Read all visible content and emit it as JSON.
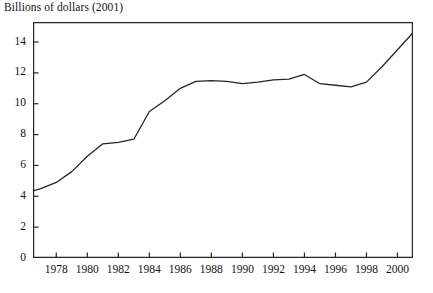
{
  "chart_data": {
    "type": "line",
    "title": "Billions of dollars (2001)",
    "xlabel": "",
    "ylabel": "Billions of dollars (2001)",
    "xlim": [
      1976.5,
      2001.0
    ],
    "ylim": [
      0,
      15.3
    ],
    "grid": false,
    "legend": null,
    "y_ticks": [
      0,
      2,
      4,
      6,
      8,
      10,
      12,
      14
    ],
    "y_tick_labels": [
      "0",
      "2",
      "4",
      "6",
      "8",
      "10",
      "12",
      "14"
    ],
    "x_ticks": [
      1978,
      1980,
      1982,
      1984,
      1986,
      1988,
      1990,
      1992,
      1994,
      1996,
      1998,
      2000
    ],
    "x_tick_labels": [
      "1978",
      "1980",
      "1982",
      "1984",
      "1986",
      "1988",
      "1990",
      "1992",
      "1994",
      "1996",
      "1998",
      "2000"
    ],
    "line_color": "#262626",
    "line_width": 1.3,
    "x": [
      1976.5,
      1977,
      1978,
      1979,
      1980,
      1981,
      1982,
      1983,
      1984,
      1985,
      1986,
      1987,
      1988,
      1989,
      1990,
      1991,
      1992,
      1993,
      1994,
      1995,
      1996,
      1997,
      1998,
      1999,
      2000,
      2001
    ],
    "values": [
      4.35,
      4.5,
      4.9,
      5.6,
      6.6,
      7.4,
      7.5,
      7.7,
      9.5,
      10.2,
      11.0,
      11.45,
      11.5,
      11.45,
      11.3,
      11.4,
      11.55,
      11.6,
      11.9,
      11.3,
      11.2,
      11.1,
      11.4,
      12.4,
      13.5,
      14.6
    ],
    "series": [
      {
        "name": "Billions of dollars (2001)",
        "values": [
          4.35,
          4.5,
          4.9,
          5.6,
          6.6,
          7.4,
          7.5,
          7.7,
          9.5,
          10.2,
          11.0,
          11.45,
          11.5,
          11.45,
          11.3,
          11.4,
          11.55,
          11.6,
          11.9,
          11.3,
          11.2,
          11.1,
          11.4,
          12.4,
          13.5,
          14.6
        ]
      }
    ]
  }
}
